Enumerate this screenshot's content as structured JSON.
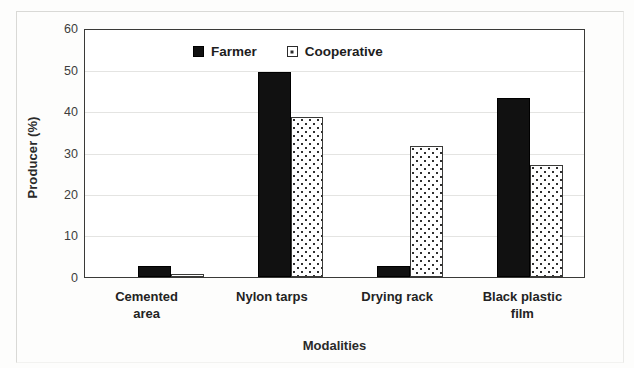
{
  "chart_data": {
    "type": "bar",
    "title": "",
    "xlabel": "Modalities",
    "ylabel": "Producer (%)",
    "categories": [
      "Cemented area",
      "Nylon tarps",
      "Drying rack",
      "Black plastic film"
    ],
    "category_lines": [
      [
        "Cemented",
        "area"
      ],
      [
        "Nylon tarps"
      ],
      [
        "Drying rack"
      ],
      [
        "Black plastic",
        "film"
      ]
    ],
    "series": [
      {
        "name": "Farmer",
        "values": [
          2.6,
          49.8,
          2.6,
          43.4
        ],
        "fill": "solid-black",
        "color": "#111111"
      },
      {
        "name": "Cooperative",
        "values": [
          0.7,
          38.9,
          31.8,
          27.2
        ],
        "fill": "dotted-hatch",
        "color": "#ffffff"
      }
    ],
    "ylim": [
      0,
      60
    ],
    "yticks": [
      0,
      10,
      20,
      30,
      40,
      50,
      60
    ],
    "ytick_labels": [
      "0",
      "10",
      "20",
      "30",
      "40",
      "50",
      "60"
    ],
    "grid": true,
    "grid_axis": "y",
    "legend_position": "top-center-inside",
    "legend_entries": [
      "Farmer",
      "Cooperative"
    ]
  }
}
